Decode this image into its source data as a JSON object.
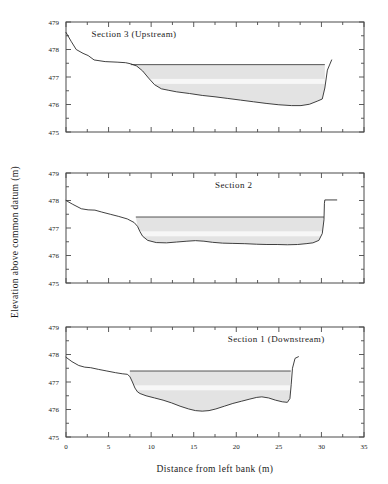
{
  "figure": {
    "axis_titles": {
      "y": "Elevation above common datum (m)",
      "x": "Distance from left bank (m)"
    }
  },
  "chart_data": {
    "type": "line",
    "title": "",
    "xlabel": "Distance from left bank (m)",
    "ylabel": "Elevation above common datum (m)",
    "xlim": [
      0,
      35
    ],
    "ylim": [
      475,
      479
    ],
    "xticks": [
      0,
      2.5,
      5,
      7.5,
      10,
      12.5,
      15,
      17.5,
      20,
      22.5,
      25,
      27.5,
      30,
      32.5,
      35
    ],
    "xtick_labels": [
      "0",
      "",
      "5",
      "",
      "10",
      "",
      "15",
      "",
      "20",
      "",
      "25",
      "",
      "30",
      "",
      "35"
    ],
    "yticks": [
      475,
      475.5,
      476,
      476.5,
      477,
      477.5,
      478,
      478.5,
      479
    ],
    "ytick_labels": [
      "475",
      "",
      "476",
      "",
      "477",
      "",
      "478",
      "",
      "479"
    ],
    "grid": false,
    "legend": "none",
    "panel_layout": "3 stacked panels, shared x-axis, top to bottom: Section 3, Section 2, Section 1",
    "panels": [
      {
        "id": "section-3",
        "title": "Section  3  (Upstream)",
        "title_x": 3.0,
        "title_y": 478.45,
        "water_surface_elevation": 477.45,
        "water_extent_x": [
          7.6,
          30.4
        ],
        "bed_profile": {
          "x": [
            0.0,
            0.6,
            1.2,
            2.0,
            2.6,
            3.3,
            4.6,
            6.0,
            7.0,
            7.6,
            8.3,
            9.0,
            9.7,
            10.4,
            11.2,
            12.0,
            13.0,
            14.5,
            16.0,
            17.5,
            19.0,
            20.5,
            22.0,
            23.5,
            25.0,
            26.5,
            27.6,
            28.6,
            29.5,
            30.1,
            30.4,
            30.7,
            31.2
          ],
          "y": [
            478.62,
            478.3,
            478.0,
            477.86,
            477.78,
            477.62,
            477.56,
            477.54,
            477.52,
            477.48,
            477.4,
            477.22,
            476.96,
            476.72,
            476.57,
            476.52,
            476.46,
            476.4,
            476.33,
            476.28,
            476.22,
            476.16,
            476.1,
            476.04,
            475.99,
            475.96,
            475.96,
            476.01,
            476.12,
            476.2,
            476.6,
            477.25,
            477.62
          ]
        }
      },
      {
        "id": "section-2",
        "title": "Section  2",
        "title_x": 17.5,
        "title_y": 478.45,
        "water_surface_elevation": 477.4,
        "water_extent_x": [
          8.2,
          30.3
        ],
        "bed_profile": {
          "x": [
            0.0,
            0.8,
            1.8,
            2.6,
            3.4,
            4.2,
            5.2,
            6.2,
            7.2,
            8.0,
            8.4,
            8.7,
            9.0,
            9.6,
            10.6,
            11.8,
            13.0,
            14.2,
            15.2,
            16.2,
            17.2,
            18.4,
            19.6,
            21.0,
            22.4,
            23.6,
            24.8,
            26.0,
            27.2,
            28.2,
            29.0,
            29.7,
            30.1,
            30.3,
            30.35,
            30.4,
            31.8
          ],
          "y": [
            478.0,
            477.86,
            477.7,
            477.66,
            477.65,
            477.58,
            477.5,
            477.42,
            477.33,
            477.2,
            477.06,
            476.86,
            476.7,
            476.55,
            476.47,
            476.46,
            476.49,
            476.52,
            476.54,
            476.52,
            476.48,
            476.45,
            476.44,
            476.43,
            476.41,
            476.4,
            476.4,
            476.39,
            476.4,
            476.43,
            476.46,
            476.55,
            476.8,
            477.3,
            477.9,
            478.02,
            478.02
          ]
        }
      },
      {
        "id": "section-1",
        "title": "Section  1  (Downstream)",
        "title_x": 19.0,
        "title_y": 478.45,
        "water_surface_elevation": 477.4,
        "water_extent_x": [
          7.5,
          26.4
        ],
        "bed_profile": {
          "x": [
            0.0,
            0.7,
            1.5,
            2.2,
            2.9,
            3.8,
            4.8,
            5.8,
            6.6,
            7.2,
            7.5,
            7.8,
            8.1,
            8.4,
            8.7,
            9.4,
            10.4,
            11.4,
            12.4,
            13.4,
            14.4,
            15.2,
            16.0,
            16.8,
            17.6,
            18.6,
            19.6,
            20.6,
            21.6,
            22.4,
            23.0,
            23.8,
            24.6,
            25.4,
            26.0,
            26.3,
            26.45,
            26.6,
            26.9,
            27.3
          ],
          "y": [
            477.9,
            477.74,
            477.6,
            477.54,
            477.52,
            477.46,
            477.4,
            477.34,
            477.3,
            477.28,
            477.2,
            477.0,
            476.78,
            476.64,
            476.58,
            476.5,
            476.42,
            476.34,
            476.24,
            476.12,
            476.02,
            475.96,
            475.94,
            475.96,
            476.02,
            476.12,
            476.22,
            476.3,
            476.38,
            476.44,
            476.46,
            476.42,
            476.34,
            476.28,
            476.26,
            476.4,
            476.9,
            477.5,
            477.86,
            477.92
          ]
        }
      }
    ]
  }
}
